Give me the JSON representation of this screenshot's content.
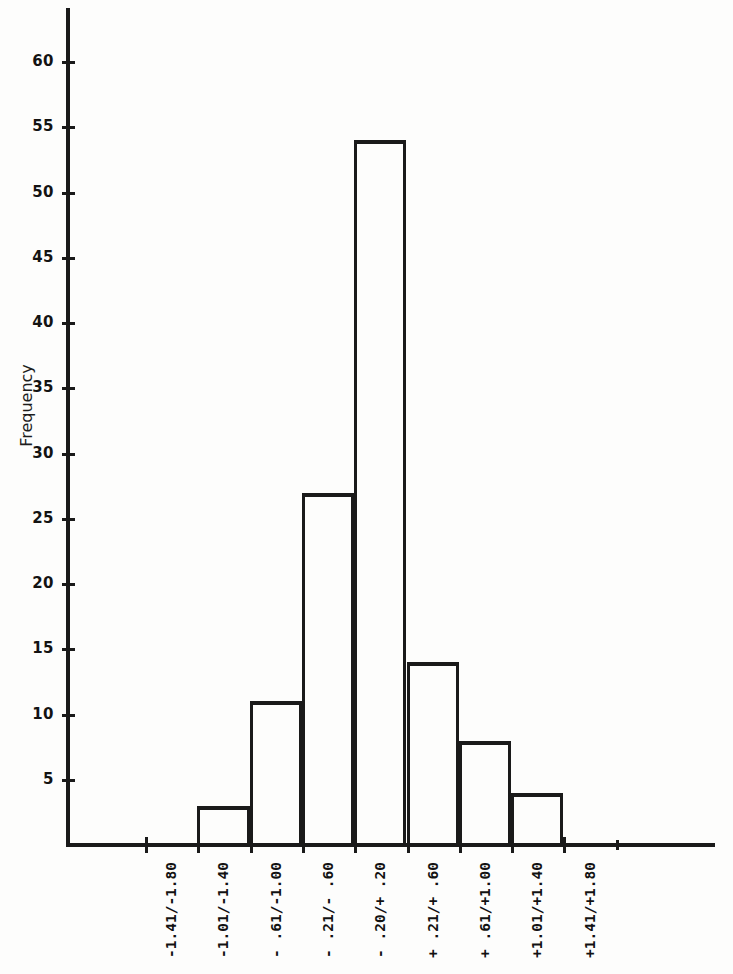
{
  "chart_data": {
    "type": "bar",
    "title": "",
    "xlabel": "",
    "ylabel": "Frequency",
    "categories": [
      "-1.41/-1.80",
      "-1.01/-1.40",
      "- .61/-1.00",
      "- .21/- .60",
      "- .20/+ .20",
      "+ .21/+ .60",
      "+ .61/+1.00",
      "+1.01/+1.40",
      "+1.41/+1.80"
    ],
    "values": [
      0,
      3,
      11,
      27,
      54,
      14,
      8,
      4,
      0
    ],
    "ylim": [
      0,
      63
    ],
    "yticks": [
      5,
      10,
      15,
      20,
      25,
      30,
      35,
      40,
      45,
      50,
      55,
      60
    ],
    "ytick_labels": [
      "5",
      "10",
      "15",
      "20",
      "25",
      "30",
      "35",
      "40",
      "45",
      "50",
      "55",
      "60"
    ],
    "grid": false,
    "legend": null,
    "bar_style": "outline",
    "line_color": "#1a1a1a"
  },
  "axis": {
    "y_title": "Frequency"
  }
}
